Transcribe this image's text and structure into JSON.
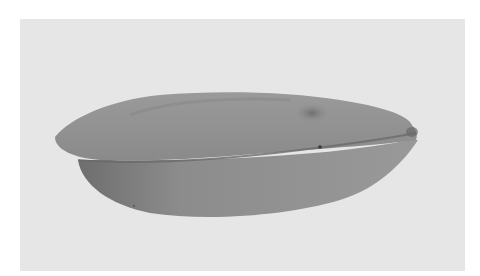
{
  "image": {
    "subject": "seed",
    "description": "Grayscale photograph of an elongated seed on a light gray background",
    "colors": {
      "background": "#e6e6e6",
      "border": "#ffffff",
      "seed_mid": "#8e8e8e",
      "seed_dark": "#6e6e6e",
      "seed_light": "#a2a2a2"
    }
  }
}
